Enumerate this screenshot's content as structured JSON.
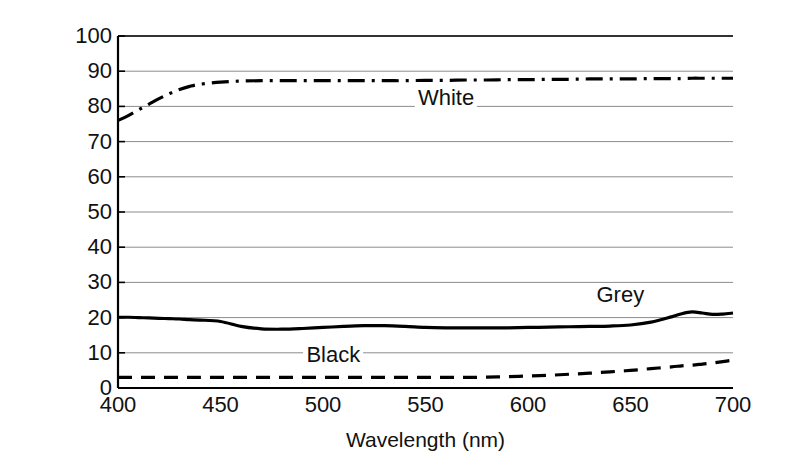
{
  "chart_data": {
    "type": "line",
    "title": "",
    "xlabel": "Wavelength (nm)",
    "ylabel": "% Reflectance",
    "xlim": [
      400,
      700
    ],
    "ylim": [
      0,
      100
    ],
    "grid": true,
    "grid_axis": "y",
    "legend": "inline-annotations",
    "x_ticks": [
      400,
      450,
      500,
      550,
      600,
      650,
      700
    ],
    "y_ticks": [
      0,
      10,
      20,
      30,
      40,
      50,
      60,
      70,
      80,
      90,
      100
    ],
    "x": [
      400,
      405,
      410,
      415,
      420,
      425,
      430,
      435,
      440,
      450,
      460,
      470,
      480,
      490,
      500,
      510,
      520,
      530,
      540,
      550,
      560,
      570,
      580,
      590,
      600,
      610,
      620,
      630,
      640,
      650,
      660,
      670,
      675,
      680,
      685,
      690,
      695,
      700
    ],
    "series": [
      {
        "name": "White",
        "linestyle": "dashdot",
        "color": "#000000",
        "values": [
          76.0,
          77.4,
          79.0,
          80.6,
          82.2,
          83.6,
          84.8,
          85.7,
          86.3,
          86.9,
          87.2,
          87.3,
          87.3,
          87.3,
          87.3,
          87.3,
          87.3,
          87.3,
          87.3,
          87.4,
          87.4,
          87.5,
          87.5,
          87.6,
          87.6,
          87.7,
          87.7,
          87.8,
          87.8,
          87.8,
          87.9,
          87.9,
          87.9,
          88.0,
          88.0,
          88.0,
          88.0,
          88.0
        ]
      },
      {
        "name": "Grey",
        "linestyle": "solid",
        "color": "#000000",
        "values": [
          20.1,
          20.1,
          20.0,
          19.9,
          19.8,
          19.7,
          19.6,
          19.4,
          19.3,
          18.9,
          17.5,
          16.8,
          16.7,
          16.9,
          17.2,
          17.5,
          17.7,
          17.7,
          17.5,
          17.2,
          17.1,
          17.1,
          17.1,
          17.1,
          17.2,
          17.3,
          17.4,
          17.5,
          17.6,
          17.9,
          18.7,
          20.2,
          21.1,
          21.6,
          21.3,
          20.9,
          21.0,
          21.3
        ]
      },
      {
        "name": "Black",
        "linestyle": "dashed",
        "color": "#000000",
        "values": [
          3.0,
          3.0,
          3.0,
          3.0,
          3.0,
          3.0,
          3.0,
          3.0,
          3.0,
          3.0,
          3.0,
          3.0,
          3.0,
          3.0,
          3.0,
          3.0,
          3.0,
          3.0,
          3.0,
          3.0,
          3.0,
          3.0,
          3.1,
          3.2,
          3.4,
          3.6,
          3.9,
          4.2,
          4.6,
          5.0,
          5.5,
          6.0,
          6.3,
          6.5,
          6.8,
          7.1,
          7.5,
          7.9
        ]
      }
    ],
    "annotations": [
      {
        "text": "White",
        "x": 560,
        "y": 82.5
      },
      {
        "text": "Grey",
        "x": 645,
        "y": 26.5
      },
      {
        "text": "Black",
        "x": 505,
        "y": 9.5
      }
    ],
    "colors": {
      "line": "#000000",
      "grid": "#8c8c8c",
      "axis": "#000000",
      "background": "#ffffff",
      "text": "#111111"
    }
  }
}
